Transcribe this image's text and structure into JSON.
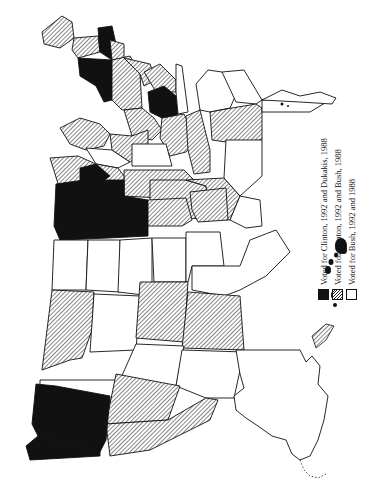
{
  "figure": {
    "type": "choropleth map",
    "orientation": "rotated 90 degrees (north to the right)",
    "colors": {
      "black": "#111111",
      "hatch": "#222222",
      "white": "#ffffff",
      "stroke": "#111111"
    }
  },
  "legend": {
    "items": [
      {
        "swatch": "black",
        "label": "Voted for Clinton, 1992 and Dukakis, 1988"
      },
      {
        "swatch": "hatched",
        "label": "Voted for Clinton, 1992 and Bush, 1988"
      },
      {
        "swatch": "white",
        "label": "Voted for Bush, 1992 and 1988"
      }
    ]
  }
}
